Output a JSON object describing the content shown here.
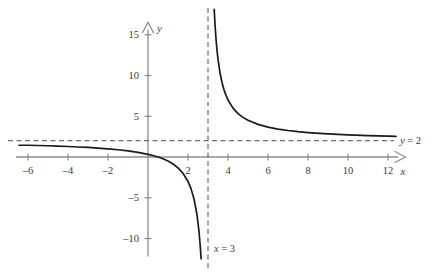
{
  "chart_data": {
    "type": "line",
    "title": "",
    "subtitle": "",
    "xlabel": "x",
    "ylabel": "y",
    "xlim": [
      -6.6,
      12.9
    ],
    "ylim": [
      -12.2,
      16.6
    ],
    "grid": false,
    "legend": "none",
    "x_ticks": [
      -6,
      -4,
      -2,
      2,
      4,
      6,
      8,
      10,
      12
    ],
    "x_tick_labels": [
      "–6",
      "–4",
      "–2",
      "2",
      "4",
      "6",
      "8",
      "10",
      "12"
    ],
    "y_ticks": [
      15,
      10,
      5,
      -5,
      -10
    ],
    "y_tick_labels": [
      "15",
      "10",
      "5",
      "–5",
      "–10"
    ],
    "annotations": [
      {
        "name": "horizontal-asymptote-label",
        "text": "y = 2",
        "italic_part": "y",
        "x": 12.6,
        "y": 2
      },
      {
        "name": "vertical-asymptote-label",
        "text": "x = 3",
        "italic_part": "x",
        "x": 3.3,
        "y": -11.2
      }
    ],
    "asymptotes": {
      "horizontal": {
        "label": "y = 2",
        "value": 2,
        "style": "dashed"
      },
      "vertical": {
        "label": "x = 3",
        "value": 3,
        "style": "dashed"
      }
    },
    "series": [
      {
        "name": "left-branch",
        "expression": "y = 2 + 5/(x - 3)",
        "style": "solid",
        "color": "#1a1a1a",
        "points": [
          [
            -6.45,
            1.44
          ],
          [
            -6.0,
            1.44
          ],
          [
            -5.5,
            1.41
          ],
          [
            -5.0,
            1.38
          ],
          [
            -4.5,
            1.33
          ],
          [
            -4.0,
            1.29
          ],
          [
            -3.5,
            1.23
          ],
          [
            -3.0,
            1.17
          ],
          [
            -2.5,
            1.09
          ],
          [
            -2.0,
            1.0
          ],
          [
            -1.5,
            0.89
          ],
          [
            -1.0,
            0.75
          ],
          [
            -0.5,
            0.57
          ],
          [
            0.0,
            0.33
          ],
          [
            0.25,
            0.18
          ],
          [
            0.5,
            0.0
          ],
          [
            0.75,
            -0.22
          ],
          [
            1.0,
            -0.5
          ],
          [
            1.25,
            -0.86
          ],
          [
            1.5,
            -1.33
          ],
          [
            1.75,
            -2.0
          ],
          [
            2.0,
            -3.0
          ],
          [
            2.15,
            -3.88
          ],
          [
            2.3,
            -5.14
          ],
          [
            2.45,
            -7.09
          ],
          [
            2.55,
            -9.11
          ],
          [
            2.62,
            -11.16
          ],
          [
            2.655,
            -12.49
          ]
        ]
      },
      {
        "name": "right-branch",
        "expression": "y = 2 + 5/(x - 3)",
        "style": "solid",
        "color": "#1a1a1a",
        "points": [
          [
            3.31,
            18.13
          ],
          [
            3.35,
            16.29
          ],
          [
            3.4,
            14.5
          ],
          [
            3.45,
            13.11
          ],
          [
            3.5,
            12.0
          ],
          [
            3.6,
            10.33
          ],
          [
            3.7,
            9.14
          ],
          [
            3.8,
            8.25
          ],
          [
            3.9,
            7.56
          ],
          [
            4.0,
            7.0
          ],
          [
            4.25,
            6.0
          ],
          [
            4.5,
            5.33
          ],
          [
            4.75,
            4.86
          ],
          [
            5.0,
            4.5
          ],
          [
            5.5,
            4.0
          ],
          [
            6.0,
            3.67
          ],
          [
            6.5,
            3.43
          ],
          [
            7.0,
            3.25
          ],
          [
            7.5,
            3.11
          ],
          [
            8.0,
            3.0
          ],
          [
            9.0,
            2.83
          ],
          [
            10.0,
            2.71
          ],
          [
            11.0,
            2.63
          ],
          [
            12.0,
            2.56
          ],
          [
            12.4,
            2.53
          ]
        ]
      }
    ],
    "colors": {
      "curve": "#1a1a1a",
      "axis": "#8c8c8c",
      "asymptote": "#4d4d4d",
      "text": "#3a3a3a",
      "background": "#ffffff"
    }
  }
}
